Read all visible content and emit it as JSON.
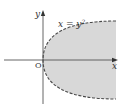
{
  "diagram": {
    "labels": {
      "y_axis": "y",
      "x_axis": "x",
      "origin": "O",
      "curve_base": "x = y",
      "curve_exp": "2"
    },
    "colors": {
      "shade": "#d8d8d8",
      "curve": "#4a4a4a",
      "axis": "#555555",
      "text": "#333333"
    },
    "curve": {
      "equation": "x = y^2",
      "style": "dashed",
      "region": "x > y^2 (shaded, boundary excluded)"
    }
  }
}
